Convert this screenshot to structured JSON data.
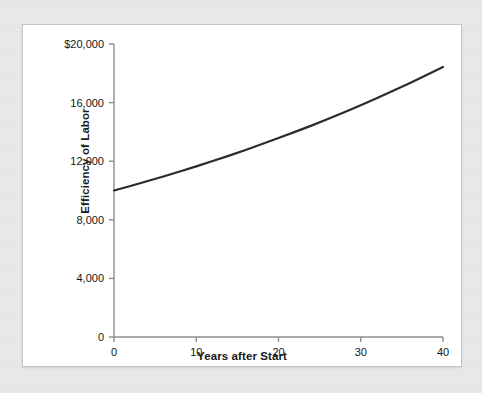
{
  "chart_data": {
    "type": "line",
    "title": "",
    "subtitle": "",
    "xlabel": "Years after Start",
    "ylabel": "Efficiency of Labor",
    "xlim": [
      0,
      40
    ],
    "ylim": [
      0,
      20000
    ],
    "grid": false,
    "legend": "none",
    "line_color": "#2b2b2b",
    "axis_color": "#8e8e8e",
    "x_ticks": [
      0,
      10,
      20,
      30,
      40
    ],
    "x_tick_labels": [
      "0",
      "10",
      "20",
      "30",
      "40"
    ],
    "y_ticks": [
      0,
      4000,
      8000,
      12000,
      16000,
      20000
    ],
    "y_tick_labels": [
      "0",
      "4,000",
      "8,000",
      "12,000",
      "16,000",
      "$20,000"
    ],
    "series": [
      {
        "name": "Efficiency of Labor",
        "x": [
          0,
          2,
          4,
          6,
          8,
          10,
          12,
          14,
          16,
          18,
          20,
          22,
          24,
          26,
          28,
          30,
          32,
          34,
          36,
          38,
          40
        ],
        "values": [
          10000,
          10310,
          10630,
          10960,
          11300,
          11650,
          12010,
          12380,
          12770,
          13170,
          13580,
          14000,
          14430,
          14880,
          15340,
          15820,
          16310,
          16820,
          17340,
          17880,
          18430
        ]
      }
    ],
    "annotations": []
  },
  "figure": {
    "panel_background": "#ffffff",
    "mat_background": "#e6e6e6"
  }
}
